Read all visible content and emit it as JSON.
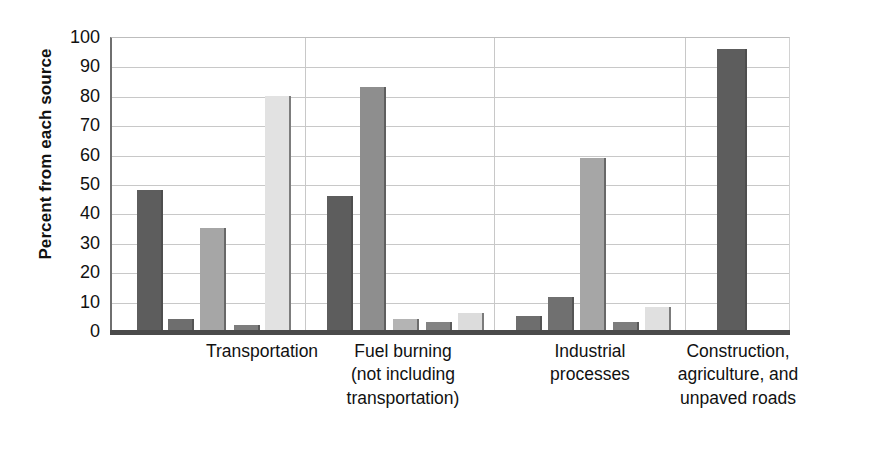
{
  "chart_data": {
    "type": "bar",
    "title": "",
    "xlabel": "",
    "ylabel": "Percent from each source",
    "ylim": [
      0,
      100
    ],
    "ytick_labels": [
      "100",
      "90",
      "80",
      "70",
      "60",
      "50",
      "40",
      "30",
      "20",
      "10",
      "0"
    ],
    "ytick_values": [
      100,
      90,
      80,
      70,
      60,
      50,
      40,
      30,
      20,
      10,
      0
    ],
    "grid": true,
    "legend": "none",
    "categories": [
      "Transportation",
      "Fuel burning (not including transportation)",
      "Industrial processes",
      "Construction, agriculture, and unpaved roads"
    ],
    "category_lines": [
      [
        "Transportation"
      ],
      [
        "Fuel burning",
        "(not including",
        "transportation)"
      ],
      [
        "Industrial",
        "processes"
      ],
      [
        "Construction,",
        "agriculture, and",
        "unpaved roads"
      ]
    ],
    "series": [
      {
        "name": "series-1",
        "color": "#5d5d5d",
        "values": [
          48,
          46,
          5,
          96
        ]
      },
      {
        "name": "series-2",
        "color": "#6b6b6b",
        "values": [
          4,
          83,
          11.5,
          null
        ]
      },
      {
        "name": "series-3",
        "color": "#a6a6a6",
        "values": [
          35,
          4,
          59,
          null
        ]
      },
      {
        "name": "series-4",
        "color": "#7a7a7a",
        "values": [
          2,
          3,
          3,
          null
        ]
      },
      {
        "name": "series-5",
        "color": "#e2e2e2",
        "values": [
          80,
          6,
          8,
          null
        ]
      }
    ],
    "bars": [
      {
        "group": 0,
        "index": 0,
        "value": 48,
        "color": "#5d5d5d",
        "x": 25,
        "width": 26
      },
      {
        "group": 0,
        "index": 1,
        "value": 4,
        "color": "#6e6e6e",
        "x": 56,
        "width": 26
      },
      {
        "group": 0,
        "index": 2,
        "value": 35,
        "color": "#a6a6a6",
        "x": 88,
        "width": 26
      },
      {
        "group": 0,
        "index": 3,
        "value": 2,
        "color": "#7d7d7d",
        "x": 122,
        "width": 26
      },
      {
        "group": 0,
        "index": 4,
        "value": 80,
        "color": "#e2e2e2",
        "x": 153,
        "width": 26
      },
      {
        "group": 1,
        "index": 0,
        "value": 46,
        "color": "#5d5d5d",
        "x": 215,
        "width": 26
      },
      {
        "group": 1,
        "index": 1,
        "value": 83,
        "color": "#8e8e8e",
        "x": 248,
        "width": 26
      },
      {
        "group": 1,
        "index": 2,
        "value": 4,
        "color": "#b4b4b4",
        "x": 281,
        "width": 26
      },
      {
        "group": 1,
        "index": 3,
        "value": 3,
        "color": "#838383",
        "x": 314,
        "width": 26
      },
      {
        "group": 1,
        "index": 4,
        "value": 6,
        "color": "#dcdcdc",
        "x": 346,
        "width": 26
      },
      {
        "group": 2,
        "index": 0,
        "value": 5,
        "color": "#6e6e6e",
        "x": 404,
        "width": 26
      },
      {
        "group": 2,
        "index": 1,
        "value": 11.5,
        "color": "#707070",
        "x": 436,
        "width": 26
      },
      {
        "group": 2,
        "index": 2,
        "value": 59,
        "color": "#a6a6a6",
        "x": 468,
        "width": 26
      },
      {
        "group": 2,
        "index": 3,
        "value": 3,
        "color": "#7d7d7d",
        "x": 501,
        "width": 26
      },
      {
        "group": 2,
        "index": 4,
        "value": 8,
        "color": "#e0e0e0",
        "x": 533,
        "width": 26
      },
      {
        "group": 3,
        "index": 0,
        "value": 96,
        "color": "#5d5d5d",
        "x": 605,
        "width": 30
      }
    ],
    "group_separators_x": [
      193,
      382,
      573
    ],
    "axis_color": "#6f6f6f",
    "grid_color": "#c8c8c8",
    "baseline_color": "#4a4a4a",
    "background_color": "#ffffff"
  }
}
